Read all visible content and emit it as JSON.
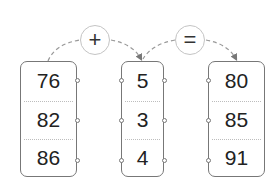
{
  "operators": {
    "plus": "+",
    "equals": "="
  },
  "columns": [
    {
      "name": "addend-a",
      "values": [
        "76",
        "82",
        "86"
      ]
    },
    {
      "name": "addend-b",
      "values": [
        "5",
        "3",
        "4"
      ]
    },
    {
      "name": "sum",
      "values": [
        "80",
        "85",
        "91"
      ]
    }
  ],
  "colors": {
    "box_border": "#777777",
    "operator_border": "#c4c4c4",
    "arrow": "#888888",
    "text": "#222222"
  }
}
